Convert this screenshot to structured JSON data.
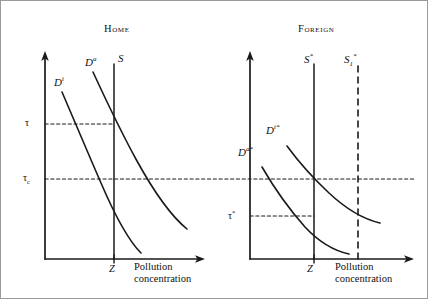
{
  "figure": {
    "type": "economics-diagram",
    "border_color": "#9a9a9a",
    "ink_color": "#1a1a1a",
    "background": "#ffffff"
  },
  "panels": [
    {
      "id": "home",
      "title": "Home",
      "axis": {
        "x_label_line1": "Pollution",
        "x_label_line2": "concentration",
        "x_tick_label": "Z",
        "y_tick_labels": [
          "τ",
          "τ"
        ],
        "y_tick_sub": [
          "",
          "c"
        ]
      },
      "curves": [
        {
          "name": "D^t",
          "base": "D",
          "sup": "t",
          "kind": "demand-curve",
          "style": "solid"
        },
        {
          "name": "D^a",
          "base": "D",
          "sup": "a",
          "kind": "demand-curve",
          "style": "solid"
        },
        {
          "name": "S",
          "base": "S",
          "sup": "",
          "kind": "supply-line",
          "style": "solid"
        }
      ],
      "guides": [
        {
          "name": "tau-guide",
          "label": "τ",
          "sub": "",
          "style": "dashed"
        },
        {
          "name": "tau-c-guide",
          "label": "τ",
          "sub": "c",
          "style": "dashed"
        }
      ]
    },
    {
      "id": "foreign",
      "title": "Foreign",
      "axis": {
        "x_label_line1": "Pollution",
        "x_label_line2": "concentration",
        "x_tick_label": "Z*",
        "y_tick_labels": [
          "τ*"
        ],
        "y_tick_sub": [
          ""
        ]
      },
      "curves": [
        {
          "name": "D^a*",
          "base": "D",
          "sup": "a*",
          "kind": "demand-curve",
          "style": "solid"
        },
        {
          "name": "D^t*",
          "base": "D",
          "sup": "t*",
          "kind": "demand-curve",
          "style": "solid"
        },
        {
          "name": "S*",
          "base": "S",
          "sup": "*",
          "kind": "supply-line",
          "style": "solid"
        },
        {
          "name": "S_1*",
          "base": "S",
          "sub": "1",
          "sup": "*",
          "kind": "supply-line",
          "style": "dashed"
        }
      ],
      "guides": [
        {
          "name": "tau-c-guide",
          "label": "",
          "sub": "",
          "style": "dashed"
        },
        {
          "name": "tau-star-guide",
          "label": "τ*",
          "sub": "",
          "style": "dashed"
        }
      ]
    }
  ],
  "labels": {
    "home_title": "Home",
    "foreign_title": "Foreign",
    "home_Dt": "D",
    "home_Dt_sup": "t",
    "home_Da": "D",
    "home_Da_sup": "a",
    "home_S": "S",
    "home_tau": "τ",
    "home_tau_c": "τ",
    "home_tau_c_sub": "c",
    "home_Z": "Z",
    "home_x1": "Pollution",
    "home_x2": "concentration",
    "for_Da": "D",
    "for_Da_sup": "a*",
    "for_Dt": "D",
    "for_Dt_sup": "t*",
    "for_S": "S",
    "for_S_sup": "*",
    "for_S1": "S",
    "for_S1_sub": "1",
    "for_S1_sup": "*",
    "for_tau": "τ",
    "for_tau_sup": "*",
    "for_Z": "Z",
    "for_Z_sup": "*",
    "for_x1": "Pollution",
    "for_x2": "concentration"
  }
}
